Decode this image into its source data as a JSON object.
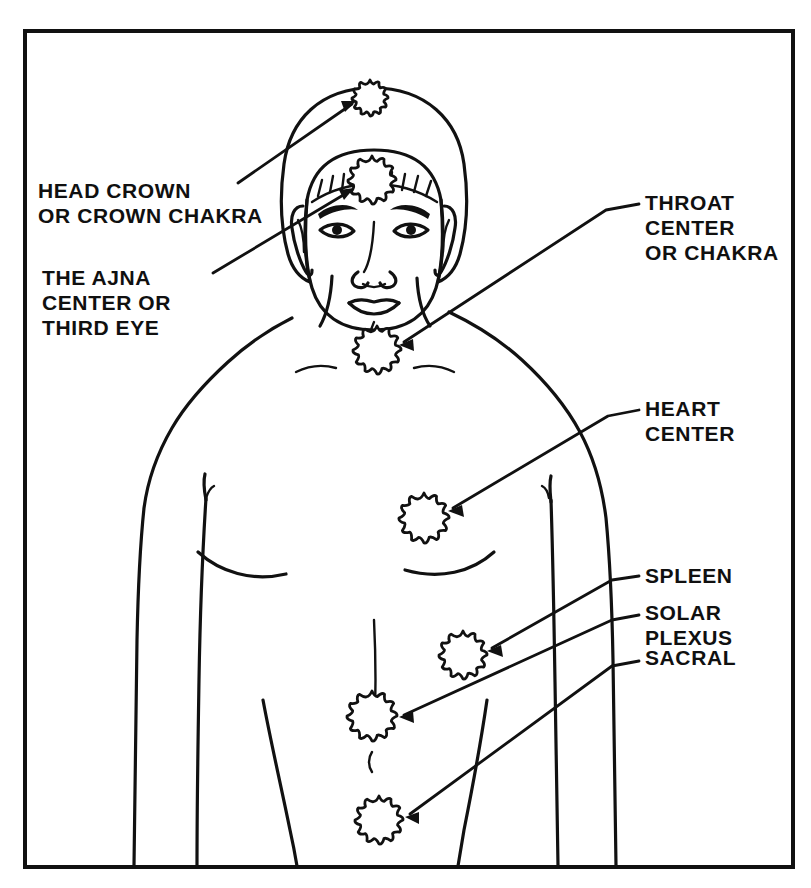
{
  "diagram": {
    "style": "black-and-white line drawing",
    "frame": {
      "color": "#111111",
      "x": 25,
      "y": 31,
      "width": 768,
      "height": 836
    },
    "marker_label": "chakra-rosette",
    "marker_count": 7
  },
  "labels": {
    "crown": {
      "name": "head-crown",
      "lines": [
        "HEAD CROWN",
        "OR CROWN CHAKRA"
      ],
      "side": "left",
      "x": 38,
      "y": 178
    },
    "ajna": {
      "name": "ajna-third-eye",
      "lines": [
        "THE AJNA",
        "CENTER OR",
        "THIRD EYE"
      ],
      "side": "left",
      "x": 42,
      "y": 265
    },
    "throat": {
      "name": "throat-center",
      "lines": [
        "THROAT",
        "CENTER",
        "OR CHAKRA"
      ],
      "side": "right",
      "x": 645,
      "y": 190
    },
    "heart": {
      "name": "heart-center",
      "lines": [
        "HEART",
        "CENTER"
      ],
      "side": "right",
      "x": 645,
      "y": 396
    },
    "spleen": {
      "name": "spleen-center",
      "lines": [
        "SPLEEN"
      ],
      "side": "right",
      "x": 645,
      "y": 563
    },
    "solar_plexus": {
      "name": "solar-plexus-center",
      "lines": [
        "SOLAR",
        "PLEXUS"
      ],
      "side": "right",
      "x": 645,
      "y": 600
    },
    "sacral": {
      "name": "sacral-center",
      "lines": [
        "SACRAL"
      ],
      "side": "right",
      "x": 645,
      "y": 645
    }
  },
  "markers": [
    {
      "id": "crown",
      "label": "HEAD CROWN OR CROWN CHAKRA",
      "x": 370,
      "y": 98,
      "r": 18
    },
    {
      "id": "ajna",
      "label": "THE AJNA CENTER OR THIRD EYE",
      "x": 372,
      "y": 180,
      "r": 24
    },
    {
      "id": "throat",
      "label": "THROAT CENTER OR CHAKRA",
      "x": 377,
      "y": 350,
      "r": 24
    },
    {
      "id": "heart",
      "label": "HEART CENTER",
      "x": 424,
      "y": 518,
      "r": 25
    },
    {
      "id": "spleen",
      "label": "SPLEEN",
      "x": 463,
      "y": 655,
      "r": 24
    },
    {
      "id": "solar_plexus",
      "label": "SOLAR PLEXUS",
      "x": 372,
      "y": 716,
      "r": 25
    },
    {
      "id": "sacral",
      "label": "SACRAL",
      "x": 379,
      "y": 820,
      "r": 24
    }
  ]
}
